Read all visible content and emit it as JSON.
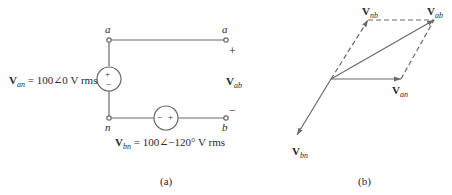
{
  "figure_a": {
    "caption": "(a)",
    "node_a_left": "a",
    "node_a_right": "a",
    "node_n": "n",
    "node_b": "b",
    "plus_sign": "+",
    "minus_sign": "−",
    "vab_label": {
      "main": "V",
      "sub": "ab"
    },
    "van_source": {
      "main": "V",
      "sub": "an",
      "value": " = 100∠0 V rms",
      "polarity_top": "+",
      "polarity_bottom": "−"
    },
    "vbn_source": {
      "main": "V",
      "sub": "bn",
      "value": " = 100∠−120° V rms",
      "polarity_left": "−",
      "polarity_right": "+"
    }
  },
  "figure_b": {
    "caption": "(b)",
    "phasors": [
      {
        "name": "V_an",
        "main": "V",
        "sub": "an",
        "from": [
          331,
          79
        ],
        "to": [
          401,
          79
        ],
        "style": "solid"
      },
      {
        "name": "V_bn",
        "main": "V",
        "sub": "bn",
        "from": [
          331,
          79
        ],
        "to": [
          297,
          135
        ],
        "style": "solid"
      },
      {
        "name": "V_ab",
        "main": "V",
        "sub": "ab",
        "from": [
          331,
          79
        ],
        "to": [
          434,
          20
        ],
        "style": "solid"
      },
      {
        "name": "V_nb",
        "main": "V",
        "sub": "nb",
        "from": [
          331,
          79
        ],
        "to": [
          368,
          20
        ],
        "style": "dashed"
      }
    ],
    "dashed_edges": [
      {
        "from": [
          368,
          20
        ],
        "to": [
          434,
          20
        ]
      },
      {
        "from": [
          401,
          79
        ],
        "to": [
          434,
          20
        ]
      }
    ]
  },
  "colors": {
    "line": "#6a6a6a",
    "text": "#2a2a2a",
    "background": "#ffffff"
  }
}
